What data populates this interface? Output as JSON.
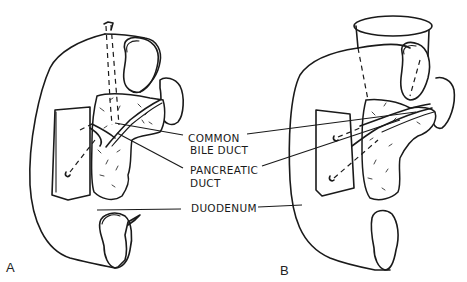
{
  "figure": {
    "panels": [
      {
        "id": "A",
        "label": "A"
      },
      {
        "id": "B",
        "label": "B"
      }
    ],
    "labels": {
      "common_bile_duct_line1": "COMMON",
      "common_bile_duct_line2": "BILE DUCT",
      "pancreatic_duct_line1": "PANCREATIC",
      "pancreatic_duct_line2": "DUCT",
      "duodenum": "DUODENUM"
    },
    "colors": {
      "ink": "#1a1a1a",
      "background": "#ffffff"
    }
  }
}
